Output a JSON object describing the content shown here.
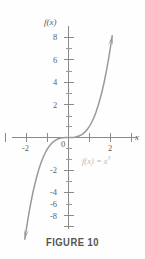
{
  "figure": {
    "caption": "FIGURE 10",
    "equation_label": "f(x) = x",
    "equation_exponent": "3",
    "axis_label_y": "f(x)",
    "axis_label_x": "x",
    "curve_color": "#9a9a96",
    "axis_color": "#8a8a86",
    "label_color": "#5d5d59",
    "equation_color": "#b9b9b5",
    "background_color": "#fefefe"
  },
  "chart_data": {
    "type": "line",
    "title": "FIGURE 10",
    "xlabel": "x",
    "ylabel": "f(x)",
    "function": "f(x) = x^3",
    "annotations": [
      "f(x) = x³"
    ],
    "xlim": [
      -3.3,
      3.3
    ],
    "ylim": [
      -9.0,
      9.0
    ],
    "grid": false,
    "legend": "none",
    "x_ticks_major": [
      -3,
      -2,
      -1,
      1,
      2,
      3
    ],
    "x_ticks_labeled": [
      -2,
      0,
      2
    ],
    "x_tick_labels": [
      "-2",
      "0",
      "2"
    ],
    "y_ticks_major": [
      -8,
      -6,
      -4,
      -2,
      2,
      4,
      6,
      8
    ],
    "y_tick_labels": [
      "8",
      "6",
      "4",
      "2",
      "-2",
      "-4",
      "-6",
      "-8"
    ],
    "y_ticks_minor": [
      -7,
      -5,
      -3,
      -1,
      1,
      3,
      5,
      7
    ],
    "arrowheads": [
      "start",
      "end"
    ],
    "x": [
      -2.08,
      -1.9,
      -1.7,
      -1.5,
      -1.3,
      -1.1,
      -0.9,
      -0.7,
      -0.5,
      -0.3,
      -0.1,
      0,
      0.1,
      0.3,
      0.5,
      0.7,
      0.9,
      1.1,
      1.3,
      1.5,
      1.7,
      1.9,
      2.08
    ],
    "y": [
      -9.0,
      -6.86,
      -4.91,
      -3.38,
      -2.2,
      -1.33,
      -0.73,
      -0.34,
      -0.13,
      -0.03,
      0.0,
      0.0,
      0.0,
      0.03,
      0.13,
      0.34,
      0.73,
      1.33,
      2.2,
      3.38,
      4.91,
      6.86,
      9.0
    ]
  }
}
